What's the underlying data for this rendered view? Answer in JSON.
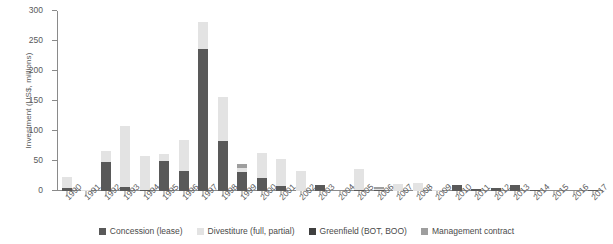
{
  "chart_data": {
    "type": "bar",
    "stacked": true,
    "title": "",
    "xlabel": "",
    "ylabel": "Investment (US$, millions)",
    "ylim": [
      0,
      300
    ],
    "yticks": [
      0,
      50,
      100,
      150,
      200,
      250,
      300
    ],
    "grid": false,
    "legend_position": "bottom",
    "categories": [
      "1990",
      "1991",
      "1992",
      "1993",
      "1994",
      "1995",
      "1996",
      "1997",
      "1998",
      "1999",
      "2000",
      "2001",
      "2002",
      "2003",
      "2004",
      "2005",
      "2006",
      "2007",
      "2008",
      "2009",
      "2010",
      "2011",
      "2012",
      "2013",
      "2014",
      "2015",
      "2016",
      "2017"
    ],
    "series": [
      {
        "name": "Concession (lease)",
        "color": "#595959",
        "values": [
          5,
          0,
          48,
          6,
          2,
          50,
          33,
          237,
          83,
          31,
          22,
          9,
          0,
          10,
          0,
          2,
          1,
          0,
          0,
          0,
          10,
          4,
          5,
          10,
          2,
          0,
          0,
          1
        ]
      },
      {
        "name": "Divestiture (full, partial)",
        "color": "#e3e3e3",
        "values": [
          18,
          1,
          18,
          102,
          56,
          11,
          52,
          45,
          74,
          8,
          41,
          44,
          33,
          0,
          0,
          35,
          3,
          11,
          13,
          2,
          0,
          0,
          0,
          0,
          0,
          0,
          0,
          0
        ]
      },
      {
        "name": "Greenfield (BOT, BOO)",
        "color": "#3f3f3f",
        "values": [
          0,
          0,
          0,
          0,
          0,
          0,
          0,
          0,
          0,
          0,
          0,
          0,
          0,
          0,
          0,
          0,
          0,
          0,
          0,
          0,
          0,
          0,
          0,
          0,
          0,
          0,
          0,
          0
        ]
      },
      {
        "name": "Management contract",
        "color": "#9e9e9e",
        "values": [
          0,
          0,
          0,
          0,
          0,
          0,
          0,
          0,
          0,
          6,
          0,
          0,
          0,
          0,
          0,
          0,
          2,
          0,
          0,
          0,
          0,
          0,
          0,
          0,
          0,
          0,
          0,
          0
        ]
      }
    ]
  },
  "legend": {
    "items": [
      {
        "label": "Concession (lease)",
        "color": "#595959",
        "name": "legend-concession"
      },
      {
        "label": "Divestiture (full, partial)",
        "color": "#e3e3e3",
        "name": "legend-divestiture"
      },
      {
        "label": "Greenfield (BOT, BOO)",
        "color": "#3f3f3f",
        "name": "legend-greenfield"
      },
      {
        "label": "Management contract",
        "color": "#9e9e9e",
        "name": "legend-management"
      }
    ]
  }
}
